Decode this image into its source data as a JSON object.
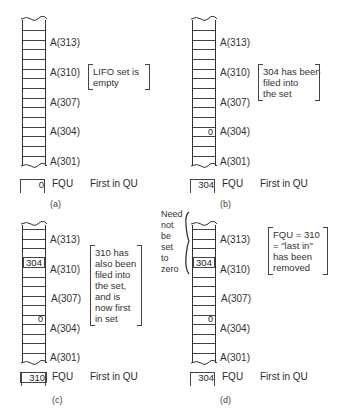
{
  "figure": {
    "panels": [
      {
        "id": "a",
        "caption": "(a)",
        "addresses": [
          "A(313)",
          "A(310)",
          "A(307)",
          "A(304)",
          "A(301)"
        ],
        "cell_values": [],
        "note_lines": [
          "LIFO set is",
          "empty"
        ],
        "fqu": {
          "value": "0",
          "name": "FQU",
          "description": "First in QU"
        }
      },
      {
        "id": "b",
        "caption": "(b)",
        "addresses": [
          "A(313)",
          "A(310)",
          "A(307)",
          "A(304)",
          "A(301)"
        ],
        "cell_values": [
          {
            "address": "A(304)",
            "value": "0"
          }
        ],
        "note_lines": [
          "304 has been",
          "filed into",
          "the set"
        ],
        "fqu": {
          "value": "304",
          "name": "FQU",
          "description": "First in QU"
        }
      },
      {
        "id": "c",
        "caption": "(c)",
        "addresses": [
          "A(313)",
          "A(310)",
          "A(307)",
          "A(304)",
          "A(301)"
        ],
        "cell_values": [
          {
            "address": "A(310)",
            "value": "304"
          },
          {
            "address": "A(304)",
            "value": "0"
          }
        ],
        "note_lines": [
          "310 has",
          "also been",
          "filed into",
          "the set,",
          "and is",
          "now first",
          "in set"
        ],
        "fqu": {
          "value": "310",
          "name": "FQU",
          "description": "First in QU"
        }
      },
      {
        "id": "d",
        "caption": "(d)",
        "addresses": [
          "A(313)",
          "A(310)",
          "A(307)",
          "A(304)",
          "A(301)"
        ],
        "cell_values": [
          {
            "address": "A(310)",
            "value": "304"
          },
          {
            "address": "A(304)",
            "value": "0"
          }
        ],
        "side_note_lines": [
          "Need",
          "not",
          "be",
          "set",
          "to",
          "zero"
        ],
        "note_lines": [
          "FQU = 310",
          "= \"last in\"",
          "has been",
          "removed"
        ],
        "fqu": {
          "value": "304",
          "name": "FQU",
          "description": "First in QU"
        }
      }
    ]
  }
}
